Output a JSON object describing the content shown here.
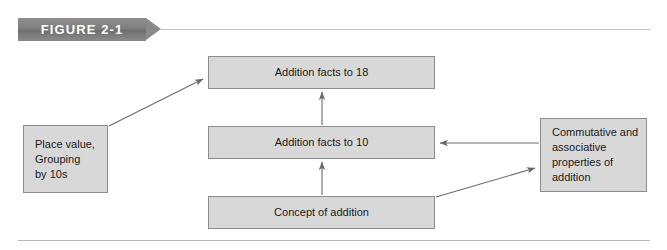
{
  "figure": {
    "label": "FIGURE 2-1",
    "banner_color": "#7e7e7e",
    "rule_color": "#c0c0c0"
  },
  "diagram": {
    "type": "flowchart",
    "node_fill": "#d8d8d8",
    "node_border": "#8c8c8c",
    "connector_color": "#6a6a6a",
    "nodes": [
      {
        "id": "facts18",
        "label": "Addition facts to 18",
        "align": "center"
      },
      {
        "id": "facts10",
        "label": "Addition facts to 10",
        "align": "center"
      },
      {
        "id": "concept",
        "label": "Concept of addition",
        "align": "center"
      },
      {
        "id": "place",
        "label": "Place value,\nGrouping\nby 10s",
        "align": "left"
      },
      {
        "id": "props",
        "label": "Commutative and\nassociative\nproperties of\naddition",
        "align": "left"
      }
    ],
    "edges": [
      {
        "id": "place-to-facts18",
        "from": "place",
        "to": "facts18",
        "style": "diagonal-up-right"
      },
      {
        "id": "facts10-to-facts18",
        "from": "facts10",
        "to": "facts18",
        "style": "vertical-up"
      },
      {
        "id": "concept-to-facts10",
        "from": "concept",
        "to": "facts10",
        "style": "vertical-up"
      },
      {
        "id": "props-to-facts10",
        "from": "props",
        "to": "facts10",
        "style": "horizontal-left"
      },
      {
        "id": "concept-to-props",
        "from": "concept",
        "to": "props",
        "style": "diagonal-up-right"
      }
    ]
  }
}
